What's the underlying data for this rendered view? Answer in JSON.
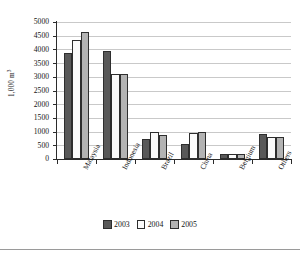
{
  "chart_data": {
    "type": "bar",
    "title": "",
    "subtitle": "",
    "xlabel": "",
    "ylabel": "1,000 m",
    "ylabel_sup": "3",
    "categories": [
      "Malaysia",
      "Indonesia",
      "Brazil",
      "China",
      "Belgium",
      "Others"
    ],
    "series": [
      {
        "name": "2003",
        "color": "#595959",
        "values": [
          3880,
          3940,
          720,
          560,
          180,
          910
        ]
      },
      {
        "name": "2004",
        "color": "#fbfbfb",
        "values": [
          4330,
          3110,
          1000,
          950,
          180,
          810
        ]
      },
      {
        "name": "2005",
        "color": "#b3b3b3",
        "values": [
          4650,
          3110,
          890,
          990,
          180,
          800
        ]
      }
    ],
    "ylim": [
      0,
      5000
    ],
    "ytick_step": 500,
    "ytick_labels": [
      "5000",
      "4500",
      "4000",
      "3500",
      "3000",
      "2500",
      "2000",
      "1500",
      "1000",
      "500",
      "0"
    ],
    "ytick_values": [
      5000,
      4500,
      4000,
      3500,
      3000,
      2500,
      2000,
      1500,
      1000,
      500,
      0
    ],
    "grid": "horizontal",
    "legend_position": "bottom-center",
    "legend_entries": [
      "2003",
      "2004",
      "2005"
    ]
  }
}
